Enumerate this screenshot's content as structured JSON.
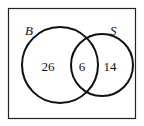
{
  "diagram": {
    "type": "venn",
    "sets": [
      {
        "label": "B",
        "only_count": "26"
      },
      {
        "label": "S",
        "only_count": "14"
      }
    ],
    "intersection_count": "6",
    "colors": {
      "stroke": "#111111",
      "background": "#ffffff"
    }
  }
}
